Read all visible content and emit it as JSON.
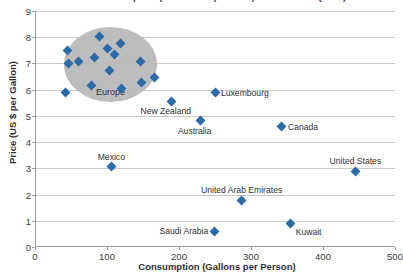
{
  "chart_data": {
    "type": "scatter",
    "title": "Gasoline Consumption per Person (Gallons) versus Price (US $)",
    "xlabel": "Consumption (Gallons per Person)",
    "ylabel": "Price (US $ per Gallon)",
    "xlim": [
      0,
      500
    ],
    "ylim": [
      0,
      9
    ],
    "xticks": [
      0,
      100,
      200,
      300,
      400,
      500
    ],
    "yticks": [
      0,
      1,
      2,
      3,
      4,
      5,
      6,
      7,
      8,
      9
    ],
    "grid": "horizontal",
    "legend": "none",
    "marker_shape": "diamond",
    "marker_color": "#2b6AA8",
    "annotations": [
      {
        "name": "Europe",
        "kind": "ellipse-highlight",
        "label": "Europe",
        "fill": "#b9b9b9",
        "center_x": 105,
        "center_y": 6.95,
        "radius_x": 65,
        "radius_y": 1.43
      }
    ],
    "points": [
      {
        "name": "Europe",
        "label": "",
        "x": 42,
        "y": 5.9,
        "group": "europe"
      },
      {
        "name": "Europe",
        "label": "",
        "x": 45,
        "y": 7.48,
        "group": "europe"
      },
      {
        "name": "Europe",
        "label": "",
        "x": 46,
        "y": 6.99,
        "group": "europe"
      },
      {
        "name": "Europe",
        "label": "",
        "x": 61,
        "y": 7.06,
        "group": "europe"
      },
      {
        "name": "Europe",
        "label": "",
        "x": 79,
        "y": 6.17,
        "group": "europe"
      },
      {
        "name": "Europe",
        "label": "",
        "x": 82,
        "y": 7.21,
        "group": "europe"
      },
      {
        "name": "Europe",
        "label": "",
        "x": 90,
        "y": 8.04,
        "group": "europe"
      },
      {
        "name": "Europe",
        "label": "",
        "x": 100,
        "y": 7.57,
        "group": "europe"
      },
      {
        "name": "Europe",
        "label": "",
        "x": 104,
        "y": 6.73,
        "group": "europe"
      },
      {
        "name": "Europe",
        "label": "",
        "x": 110,
        "y": 7.34,
        "group": "europe"
      },
      {
        "name": "Europe",
        "label": "",
        "x": 119,
        "y": 7.77,
        "group": "europe"
      },
      {
        "name": "Europe",
        "label": "",
        "x": 120,
        "y": 6.06,
        "group": "europe"
      },
      {
        "name": "Europe",
        "label": "",
        "x": 147,
        "y": 7.06,
        "group": "europe"
      },
      {
        "name": "Europe",
        "label": "",
        "x": 148,
        "y": 6.28,
        "group": "europe"
      },
      {
        "name": "Europe",
        "label": "",
        "x": 166,
        "y": 6.46,
        "group": "europe"
      },
      {
        "name": "New Zealand",
        "label": "New Zealand",
        "x": 190,
        "y": 5.56,
        "label_pos": "below-left"
      },
      {
        "name": "Luxembourg",
        "label": "Luxembourg",
        "x": 250,
        "y": 5.88,
        "label_pos": "right"
      },
      {
        "name": "Australia",
        "label": "Australia",
        "x": 230,
        "y": 4.81,
        "label_pos": "below-left"
      },
      {
        "name": "Canada",
        "label": "Canada",
        "x": 343,
        "y": 4.58,
        "label_pos": "right"
      },
      {
        "name": "Mexico",
        "label": "Mexico",
        "x": 106,
        "y": 3.06,
        "label_pos": "above"
      },
      {
        "name": "United States",
        "label": "United States",
        "x": 445,
        "y": 2.88,
        "label_pos": "above"
      },
      {
        "name": "United Arab Emirates",
        "label": "United Arab Emirates",
        "x": 287,
        "y": 1.79,
        "label_pos": "above"
      },
      {
        "name": "Kuwait",
        "label": "Kuwait",
        "x": 355,
        "y": 0.88,
        "label_pos": "below-right"
      },
      {
        "name": "Saudi Arabia",
        "label": "Saudi Arabia",
        "x": 249,
        "y": 0.6,
        "label_pos": "left"
      }
    ]
  }
}
